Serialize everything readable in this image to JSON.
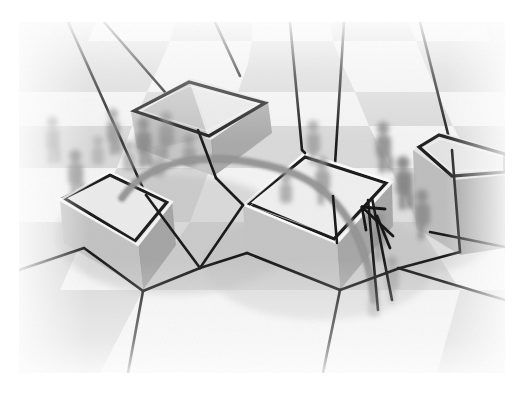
{
  "scene": {
    "title": "3D perspective visualization of boxed regions on a checkerboard floor",
    "kind": "grayscale-render",
    "canvas": {
      "width": 527,
      "height": 396
    },
    "margins": {
      "left": 19,
      "top": 22,
      "right": 505,
      "bottom": 373
    },
    "palette": {
      "page_background": "#ffffff",
      "floor_light": "#f2f2f2",
      "floor_dark": "#d8d8d8",
      "floor_haze": "#ededed",
      "box_top": "#efefef",
      "box_left": "#cfcfcf",
      "box_front": "#bdbdbd",
      "box_right": "#a8a8a8",
      "box_shadow": "#9a9a9a",
      "outline_dark": "#1d1d1d",
      "partition_line": "#161616",
      "arc_gray": "#8e8e8e",
      "figure_ghost": "#9b9b9b",
      "figure_ghost_dark": "#7b7b7b"
    },
    "floor": {
      "label": "checkerboard-floor",
      "tiles_across": 8,
      "tiles_deep": 7,
      "horizon_y": 22,
      "perspective": "one-point, camera high oblique"
    },
    "boxes": [
      {
        "id": "box-back",
        "label": "Back box",
        "top_outline": "thin elongated quadrilateral",
        "position": {
          "x": 130,
          "y": 78
        },
        "size": {
          "w": 140,
          "h": 150
        }
      },
      {
        "id": "box-left",
        "label": "Left box",
        "top_outline": "square quadrilateral",
        "position": {
          "x": 40,
          "y": 172
        },
        "size": {
          "w": 140,
          "h": 140
        }
      },
      {
        "id": "box-center",
        "label": "Center box",
        "top_outline": "square quadrilateral",
        "position": {
          "x": 225,
          "y": 150
        },
        "size": {
          "w": 160,
          "h": 155
        }
      },
      {
        "id": "box-right",
        "label": "Right box",
        "top_outline": "thin elongated quadrilateral",
        "position": {
          "x": 400,
          "y": 128
        },
        "size": {
          "w": 105,
          "h": 135
        }
      }
    ],
    "annotations": {
      "arc_label": "curved trajectory arc",
      "arrow_label": "arrowhead marker",
      "partition_label": "partition edge network",
      "figures_label": "blurred pedestrian figures",
      "figure_count": 14
    }
  }
}
